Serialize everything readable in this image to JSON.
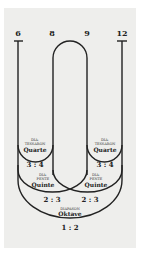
{
  "diagram": {
    "top_numbers": [
      "6",
      "8",
      "9",
      "12"
    ],
    "intervals": [
      {
        "greek": [
          "DIA-",
          "TESSARON"
        ],
        "name": "Quarte",
        "ratio": "3 : 4",
        "side": "left"
      },
      {
        "greek": [
          "DIA-",
          "TESSARON"
        ],
        "name": "Quarte",
        "ratio": "3 : 4",
        "side": "right"
      },
      {
        "greek": [
          "DIA-",
          "PENTE"
        ],
        "name": "Quinte",
        "ratio": "2 : 3",
        "side": "left"
      },
      {
        "greek": [
          "DIA-",
          "PENTE"
        ],
        "name": "Quinte",
        "ratio": "2 : 3",
        "side": "right"
      },
      {
        "greek": [
          "DIAPASON"
        ],
        "name": "Oktave",
        "ratio": "1 : 2",
        "side": "center"
      }
    ],
    "colors": {
      "background": "#eeeeec",
      "line": "#222222"
    }
  }
}
